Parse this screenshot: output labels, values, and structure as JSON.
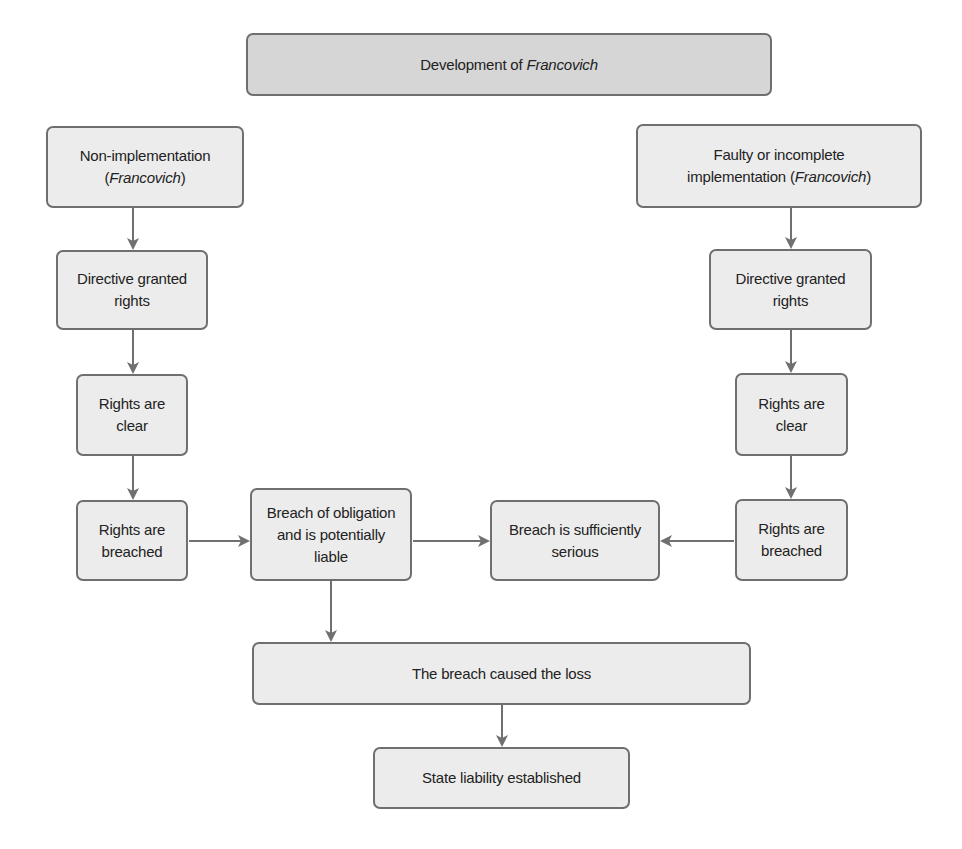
{
  "title": {
    "prefix": "Development of ",
    "italic": "Francovich"
  },
  "left_branch": {
    "start": {
      "line1": "Non-implementation",
      "line2_open": "(",
      "line2_italic": "Francovich",
      "line2_close": ")"
    },
    "directive": "Directive granted rights",
    "clear": "Rights are clear",
    "breached": "Rights are breached"
  },
  "right_branch": {
    "start": {
      "line1": "Faulty or incomplete",
      "line2_prefix": "implementation (",
      "line2_italic": "Francovich",
      "line2_close": ")"
    },
    "directive": "Directive granted rights",
    "clear": "Rights are clear",
    "breached": "Rights are breached"
  },
  "middle": {
    "breach_obligation": "Breach of obligation and is potentially liable",
    "sufficiently_serious": "Breach is sufficiently serious"
  },
  "bottom": {
    "causation": "The breach caused the loss",
    "result": "State liability established"
  },
  "colors": {
    "title_fill": "#d6d6d6",
    "box_fill": "#ececec",
    "border": "#6f6f6f",
    "arrow": "#707070",
    "text": "#222222"
  }
}
